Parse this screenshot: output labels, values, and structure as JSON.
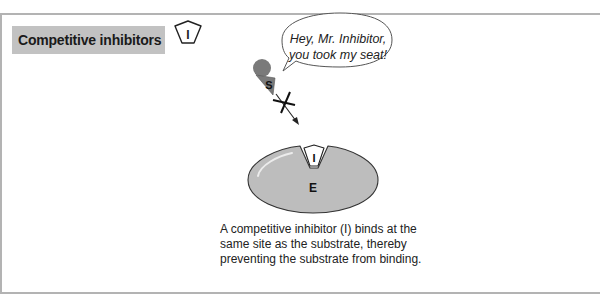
{
  "header": {
    "title": "Competitive inhibitors",
    "legend_icon": {
      "name": "inhibitor-icon",
      "label": "I"
    }
  },
  "diagram": {
    "speech_bubble": {
      "line1": "Hey, Mr. Inhibitor,",
      "line2": "you took my seat!"
    },
    "substrate_label": "S",
    "inhibitor_label": "I",
    "enzyme_label": "E",
    "colors": {
      "title_background": "#c2c2c2",
      "enzyme_fill": "#bdbdbd",
      "substrate_fill": "#7a7a7a",
      "frame": "#b3b3b3"
    }
  },
  "caption": {
    "line1": "A competitive inhibitor (I) binds at the",
    "line2": "same site as the substrate, thereby",
    "line3": "preventing the substrate from binding."
  }
}
